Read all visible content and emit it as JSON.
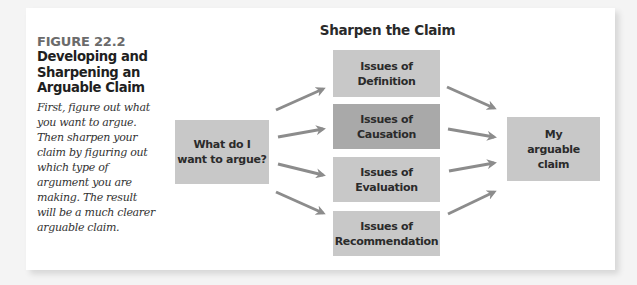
{
  "figure": {
    "number": "FIGURE 22.2",
    "title": "Developing and Sharpening an Arguable Claim",
    "description": "First, figure out what you want to argue. Then sharpen your claim by figuring out which type of argument you are making. The result will be a much clearer arguable claim."
  },
  "diagram": {
    "title": "Sharpen the Claim",
    "start": {
      "label": "What do I want to argue?"
    },
    "issues": [
      {
        "label": "Issues of Definition",
        "shade": "light"
      },
      {
        "label": "Issues of Causation",
        "shade": "dark"
      },
      {
        "label": "Issues of Evaluation",
        "shade": "light"
      },
      {
        "label": "Issues of Recommendation",
        "shade": "light"
      }
    ],
    "end": {
      "label": "My arguable claim"
    },
    "colors": {
      "box_fill": "#c8c8c8",
      "box_fill_dark": "#a9a9a9",
      "arrow": "#8c8c8c",
      "figure_number": "#6b6b6b"
    }
  }
}
